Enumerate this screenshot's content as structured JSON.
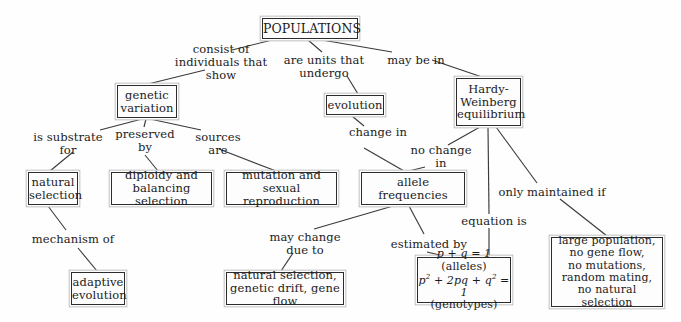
{
  "diagram": {
    "type": "concept-map",
    "root": "POPULATIONS",
    "colors": {
      "background": "#fefefe",
      "box_border": "#2c2c2c",
      "box_outer_border": "#b9b9b9",
      "line": "#3a3a3a",
      "text": "#1b1b1b"
    },
    "nodes": [
      {
        "id": "populations",
        "label": "POPULATIONS",
        "x": 262,
        "y": 18,
        "w": 96,
        "h": 21,
        "fs": 12.5,
        "double": true
      },
      {
        "id": "genetic-variation",
        "label": "genetic\nvariation",
        "x": 117,
        "y": 85,
        "w": 60,
        "h": 33,
        "fs": 11.5,
        "double": true
      },
      {
        "id": "evolution",
        "label": "evolution",
        "x": 326,
        "y": 95,
        "w": 58,
        "h": 20,
        "fs": 11.5,
        "double": true
      },
      {
        "id": "hardy-weinberg",
        "label": "Hardy-\nWeinberg\nequilibrium",
        "x": 456,
        "y": 78,
        "w": 65,
        "h": 48,
        "fs": 11.5,
        "double": true
      },
      {
        "id": "natural-selection",
        "label": "natural\nselection",
        "x": 28,
        "y": 172,
        "w": 50,
        "h": 33,
        "fs": 11.5,
        "double": true
      },
      {
        "id": "diploidy-balancing",
        "label": "diploidy and\nbalancing selection",
        "x": 111,
        "y": 172,
        "w": 101,
        "h": 33,
        "fs": 11.5,
        "double": true
      },
      {
        "id": "mutation-sexual",
        "label": "mutation and\nsexual reproduction",
        "x": 226,
        "y": 172,
        "w": 111,
        "h": 33,
        "fs": 11.5,
        "double": true
      },
      {
        "id": "allele-frequencies",
        "label": "allele\nfrequencies",
        "x": 361,
        "y": 172,
        "w": 104,
        "h": 33,
        "fs": 11.5,
        "double": true
      },
      {
        "id": "adaptive-evolution",
        "label": "adaptive\nevolution",
        "x": 71,
        "y": 272,
        "w": 54,
        "h": 33,
        "fs": 11.5,
        "double": true
      },
      {
        "id": "ns-gd-gf",
        "label": "natural selection,\ngenetic drift, gene flow",
        "x": 226,
        "y": 272,
        "w": 118,
        "h": 33,
        "fs": 11.5,
        "double": true
      },
      {
        "id": "hw-equation",
        "label": "p + q = 1 (alleles)\np2 + 2pq + q2 = 1\n(genotypes)",
        "x": 417,
        "y": 257,
        "w": 94,
        "h": 46,
        "fs": 11,
        "double": true
      },
      {
        "id": "hw-conditions",
        "label": "large population,\nno gene flow,\nno mutations,\nrandom mating,\nno natural selection",
        "x": 551,
        "y": 237,
        "w": 112,
        "h": 70,
        "fs": 11,
        "double": true
      }
    ],
    "link_labels": [
      {
        "id": "consist-of",
        "text": "consist of\nindividuals that\nshow",
        "x": 161,
        "y": 43,
        "w": 120,
        "fs": 11.5
      },
      {
        "id": "are-units-that-undergo",
        "text": "are units that\nundergo",
        "x": 279,
        "y": 54,
        "w": 90,
        "fs": 11.5
      },
      {
        "id": "may-be-in",
        "text": "may be in",
        "x": 383,
        "y": 54,
        "w": 66,
        "fs": 11.5
      },
      {
        "id": "is-substrate-for",
        "text": "is substrate\nfor",
        "x": 32,
        "y": 131,
        "w": 72,
        "fs": 11.5
      },
      {
        "id": "preserved-by",
        "text": "preserved\nby",
        "x": 113,
        "y": 128,
        "w": 64,
        "fs": 11.5
      },
      {
        "id": "sources-are",
        "text": "sources\nare",
        "x": 191,
        "y": 131,
        "w": 54,
        "fs": 11.5
      },
      {
        "id": "change-in",
        "text": "change in",
        "x": 345,
        "y": 126,
        "w": 66,
        "fs": 11.5
      },
      {
        "id": "no-change-in",
        "text": "no change\nin",
        "x": 408,
        "y": 144,
        "w": 66,
        "fs": 11.5
      },
      {
        "id": "only-maintained-if",
        "text": "only maintained if",
        "x": 497,
        "y": 186,
        "w": 110,
        "fs": 11.5
      },
      {
        "id": "mechanism-of",
        "text": "mechanism of",
        "x": 27,
        "y": 233,
        "w": 92,
        "fs": 11.5
      },
      {
        "id": "may-change-due-to",
        "text": "may change\ndue to",
        "x": 267,
        "y": 231,
        "w": 76,
        "fs": 11.5
      },
      {
        "id": "estimated-by",
        "text": "estimated by",
        "x": 387,
        "y": 238,
        "w": 84,
        "fs": 11.5
      },
      {
        "id": "equation-is",
        "text": "equation is",
        "x": 458,
        "y": 215,
        "w": 72,
        "fs": 11.5
      }
    ],
    "edges": [
      {
        "id": "pop-to-consist",
        "x1": 272,
        "y1": 40,
        "x2": 232,
        "y2": 50
      },
      {
        "id": "consist-to-genetic",
        "x1": 205,
        "y1": 70,
        "x2": 148,
        "y2": 84
      },
      {
        "id": "pop-to-areunits",
        "x1": 308,
        "y1": 40,
        "x2": 322,
        "y2": 52
      },
      {
        "id": "areunits-to-evolution",
        "x1": 347,
        "y1": 76,
        "x2": 358,
        "y2": 94
      },
      {
        "id": "pop-to-maybein",
        "x1": 322,
        "y1": 40,
        "x2": 392,
        "y2": 52
      },
      {
        "id": "maybein-to-hw",
        "x1": 432,
        "y1": 60,
        "x2": 482,
        "y2": 77
      },
      {
        "id": "genetic-to-issub",
        "x1": 142,
        "y1": 119,
        "x2": 100,
        "y2": 130
      },
      {
        "id": "issub-to-natural",
        "x1": 73,
        "y1": 152,
        "x2": 50,
        "y2": 171
      },
      {
        "id": "genetic-to-preserved",
        "x1": 146,
        "y1": 119,
        "x2": 144,
        "y2": 127
      },
      {
        "id": "preserved-to-diploidy",
        "x1": 145,
        "y1": 155,
        "x2": 158,
        "y2": 171
      },
      {
        "id": "genetic-to-sources",
        "x1": 150,
        "y1": 119,
        "x2": 201,
        "y2": 130
      },
      {
        "id": "sources-to-mutation",
        "x1": 219,
        "y1": 149,
        "x2": 276,
        "y2": 171
      },
      {
        "id": "evolution-to-change",
        "x1": 352,
        "y1": 116,
        "x2": 364,
        "y2": 126
      },
      {
        "id": "change-to-allele",
        "x1": 364,
        "y1": 148,
        "x2": 404,
        "y2": 171
      },
      {
        "id": "hw-to-nochange",
        "x1": 480,
        "y1": 127,
        "x2": 448,
        "y2": 145
      },
      {
        "id": "nochange-to-allele",
        "x1": 425,
        "y1": 167,
        "x2": 409,
        "y2": 171
      },
      {
        "id": "hw-to-equation",
        "x1": 488,
        "y1": 127,
        "x2": 489,
        "y2": 214
      },
      {
        "id": "equation-to-eqbox",
        "x1": 489,
        "y1": 228,
        "x2": 489,
        "y2": 256
      },
      {
        "id": "hw-to-onlymaint",
        "x1": 496,
        "y1": 127,
        "x2": 537,
        "y2": 183
      },
      {
        "id": "onlymaint-to-cond",
        "x1": 560,
        "y1": 199,
        "x2": 607,
        "y2": 236
      },
      {
        "id": "natural-to-mechanism",
        "x1": 48,
        "y1": 206,
        "x2": 66,
        "y2": 230
      },
      {
        "id": "mechanism-to-adaptive",
        "x1": 78,
        "y1": 248,
        "x2": 97,
        "y2": 271
      },
      {
        "id": "allele-to-maychange",
        "x1": 393,
        "y1": 206,
        "x2": 314,
        "y2": 229
      },
      {
        "id": "maychange-to-nsgdgf",
        "x1": 293,
        "y1": 253,
        "x2": 281,
        "y2": 271
      },
      {
        "id": "allele-to-estimated",
        "x1": 409,
        "y1": 206,
        "x2": 424,
        "y2": 234
      },
      {
        "id": "estimated-to-eqbox",
        "x1": 427,
        "y1": 252,
        "x2": 444,
        "y2": 256
      }
    ]
  }
}
